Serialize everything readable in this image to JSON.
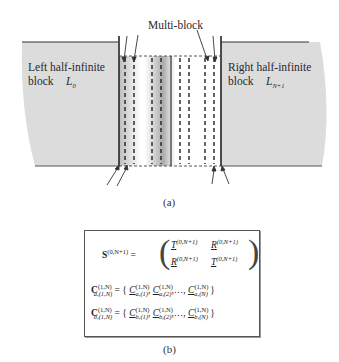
{
  "figure_a": {
    "caption": "(a)",
    "multi_block_label": "Multi-block",
    "left_block": {
      "line1": "Left half-infinite",
      "line2": "block",
      "symbol": "L",
      "subscript": "0"
    },
    "right_block": {
      "line1": "Right half-infinite",
      "line2": "block",
      "symbol": "L",
      "subscript": "N+1"
    },
    "colors": {
      "block_fill": "#d9d9d9",
      "outline": "#333333",
      "dashed": "#333333"
    }
  },
  "figure_b": {
    "caption": "(b)",
    "eq1": {
      "lhs": "S",
      "lhs_sup": "(0,N+1)",
      "m11": "T",
      "m12": "R",
      "m21": "R",
      "m22": "T",
      "sup": "(0,N+1)"
    },
    "eq2": {
      "lhs": "C",
      "lhs_sup": "(1,N)",
      "lhs_sub": "a,(1,N)",
      "items": [
        "a,(1)",
        "a,(2)",
        "a,(N)"
      ],
      "item_sup": "(1,N)"
    },
    "eq3": {
      "lhs": "C",
      "lhs_sup": "(1,N)",
      "lhs_sub": "b,(1,N)",
      "items": [
        "b,(1)",
        "b,(2)",
        "b,(N)"
      ],
      "item_sup": "(1,N)"
    }
  }
}
